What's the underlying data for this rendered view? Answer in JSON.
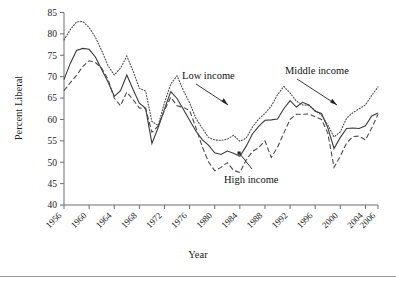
{
  "figure": {
    "background": "#ffffff",
    "rule_color": "#9a9a9a"
  },
  "axes": {
    "y_title": "Percent Liberal",
    "x_title": "Year",
    "y_ticks": [
      "40",
      "45",
      "50",
      "55",
      "60",
      "65",
      "70",
      "75",
      "80",
      "85"
    ],
    "x_ticks": [
      "1956",
      "1960",
      "1964",
      "1968",
      "1972",
      "1976",
      "1980",
      "1984",
      "1988",
      "1992",
      "1996",
      "2000",
      "2004",
      "2006"
    ]
  },
  "annotations": [
    {
      "key": "low",
      "label": "Low income"
    },
    {
      "key": "middle",
      "label": "Middle income"
    },
    {
      "key": "high",
      "label": "High income"
    }
  ],
  "chart_data": {
    "type": "line",
    "title": "",
    "subtitle": "",
    "xlabel": "Year",
    "ylabel": "Percent Liberal",
    "xlim": [
      1956,
      2006
    ],
    "ylim": [
      40,
      85
    ],
    "yticks": [
      40,
      45,
      50,
      55,
      60,
      65,
      70,
      75,
      80,
      85
    ],
    "xticks": [
      1956,
      1960,
      1964,
      1968,
      1972,
      1976,
      1980,
      1984,
      1988,
      1992,
      1996,
      2000,
      2004,
      2006
    ],
    "grid": false,
    "legend": "inline-annotations",
    "annotations": [
      {
        "text": "Low income",
        "points_to_year": 1983,
        "points_to_value": 63.5
      },
      {
        "text": "Middle income",
        "points_to_year": 2000,
        "points_to_value": 63.5
      },
      {
        "text": "High income",
        "points_to_year": 1984,
        "points_to_value": 52.0
      }
    ],
    "x": [
      1956,
      1957,
      1958,
      1959,
      1960,
      1961,
      1962,
      1963,
      1964,
      1965,
      1966,
      1967,
      1968,
      1969,
      1970,
      1971,
      1972,
      1973,
      1974,
      1975,
      1976,
      1977,
      1978,
      1979,
      1980,
      1981,
      1982,
      1983,
      1984,
      1985,
      1986,
      1987,
      1988,
      1989,
      1990,
      1991,
      1992,
      1993,
      1994,
      1995,
      1996,
      1997,
      1998,
      1999,
      2000,
      2001,
      2002,
      2003,
      2004,
      2005,
      2006
    ],
    "series": [
      {
        "name": "Low income",
        "style": "dotted",
        "color": "#4a4a4a",
        "values": [
          78.6,
          81.0,
          82.8,
          82.9,
          81.5,
          79.2,
          76.1,
          72.6,
          70.4,
          72.0,
          74.8,
          71.3,
          67.3,
          66.6,
          59.5,
          58.6,
          63.9,
          68.3,
          70.2,
          66.8,
          63.9,
          60.3,
          58.0,
          55.8,
          55.2,
          55.1,
          55.4,
          56.3,
          54.9,
          55.6,
          58.2,
          60.1,
          61.4,
          63.1,
          65.8,
          67.7,
          66.2,
          64.3,
          63.4,
          63.3,
          62.1,
          61.0,
          58.7,
          55.9,
          57.1,
          60.3,
          61.6,
          62.5,
          63.4,
          65.6,
          67.6
        ]
      },
      {
        "name": "Middle income",
        "style": "solid",
        "color": "#3a3a3a",
        "values": [
          69.3,
          73.1,
          76.1,
          76.6,
          76.4,
          74.6,
          71.7,
          68.8,
          65.4,
          66.7,
          70.4,
          67.0,
          63.8,
          62.6,
          54.4,
          58.1,
          62.4,
          66.5,
          64.9,
          62.4,
          59.8,
          57.3,
          55.3,
          54.0,
          52.2,
          51.8,
          52.6,
          52.1,
          51.4,
          53.7,
          56.6,
          58.4,
          59.8,
          59.9,
          60.1,
          62.5,
          64.4,
          62.9,
          64.0,
          63.4,
          61.9,
          61.4,
          58.1,
          53.2,
          55.8,
          57.9,
          58.0,
          57.9,
          58.5,
          60.8,
          61.5
        ]
      },
      {
        "name": "High income",
        "style": "dashed",
        "color": "#4a4a4a",
        "values": [
          66.7,
          68.6,
          70.3,
          72.4,
          73.7,
          73.3,
          72.0,
          69.4,
          65.0,
          63.2,
          66.4,
          64.6,
          62.7,
          62.5,
          57.0,
          58.5,
          62.1,
          65.2,
          63.2,
          62.8,
          62.1,
          58.1,
          53.7,
          50.1,
          48.0,
          48.8,
          49.9,
          48.1,
          47.6,
          50.5,
          52.5,
          53.4,
          55.0,
          51.1,
          53.5,
          56.8,
          60.0,
          61.2,
          61.2,
          61.3,
          60.6,
          60.0,
          56.8,
          48.8,
          51.4,
          54.5,
          56.0,
          56.1,
          55.2,
          58.0,
          61.2
        ]
      }
    ]
  }
}
